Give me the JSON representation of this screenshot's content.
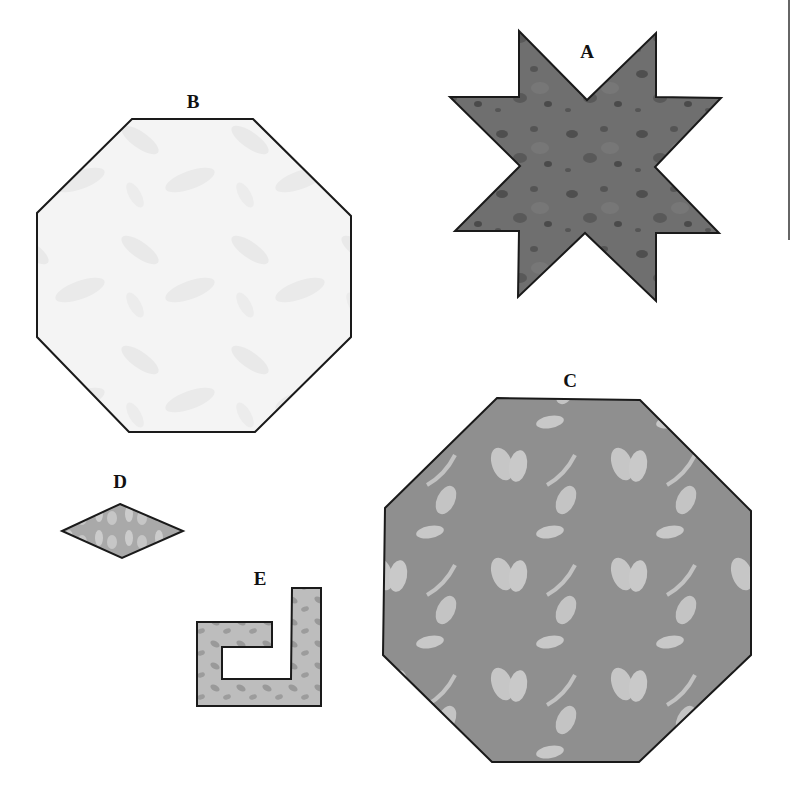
{
  "figure": {
    "pieces": [
      {
        "label": "A",
        "shape": "eight-pointed star",
        "fill": "#6f6f6f",
        "pattern_color": "#4d4d4d"
      },
      {
        "label": "B",
        "shape": "octagon",
        "fill": "#f3f3f3",
        "pattern_color": "#e4e4e4"
      },
      {
        "label": "C",
        "shape": "octagon",
        "fill": "#8f8f8f",
        "pattern_color": "#c9c9c9"
      },
      {
        "label": "D",
        "shape": "diamond",
        "fill": "#a6a6a6",
        "pattern_color": "#c8c8c8"
      },
      {
        "label": "E",
        "shape": "hook / J-shape",
        "fill": "#b5b5b5",
        "pattern_color": "#8f8f8f"
      }
    ],
    "outline_color": "#1a1a1a",
    "edge_line_color": "#666666"
  }
}
